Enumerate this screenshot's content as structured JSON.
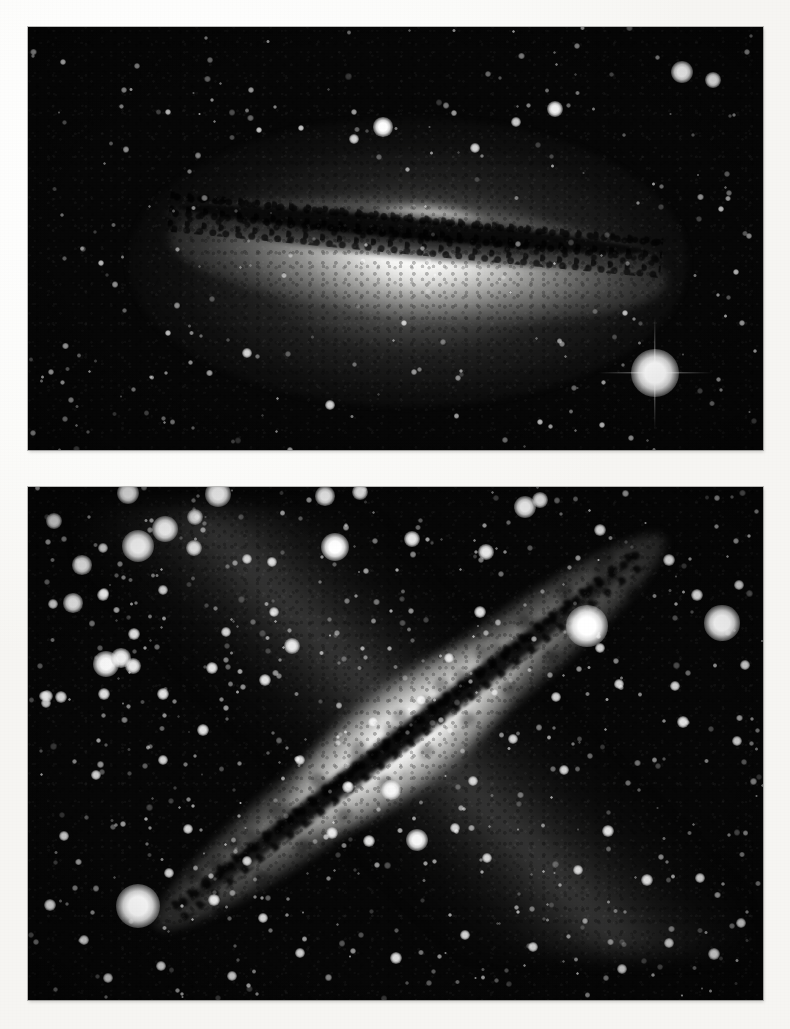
{
  "page": {
    "kind": "photographic-plate-figure",
    "background_color": "#fbfaf8",
    "width": 790,
    "height": 1029,
    "visible_text": []
  },
  "panels": [
    {
      "id": "panel-top",
      "name": "sombrero-galaxy-plate",
      "subject": "edge-on spiral galaxy with prominent equatorial dust lane and large bright bulge",
      "frame": {
        "x": 28,
        "y": 27,
        "width": 735,
        "height": 423
      },
      "image": {
        "medium": "black-and-white astronomical photograph",
        "sky_color": "#070707",
        "core_color": "#ffffff",
        "dust_lane_color": "#0a0a0a",
        "core_position": {
          "x": 390,
          "y": 243
        },
        "disk_tilt_degrees": 5.2,
        "halo_extent": {
          "width": 560,
          "height": 290
        }
      },
      "stars": [
        {
          "x": 655,
          "y": 373,
          "size": 15,
          "brightness": 1.0,
          "spikes": true
        },
        {
          "x": 682,
          "y": 72,
          "size": 7,
          "brightness": 0.9,
          "spikes": false
        },
        {
          "x": 713,
          "y": 80,
          "size": 5,
          "brightness": 0.8,
          "spikes": false
        },
        {
          "x": 555,
          "y": 109,
          "size": 5,
          "brightness": 0.8,
          "spikes": false
        },
        {
          "x": 383,
          "y": 127,
          "size": 6,
          "brightness": 0.9,
          "spikes": false
        },
        {
          "x": 354,
          "y": 139,
          "size": 3,
          "brightness": 0.6,
          "spikes": false
        },
        {
          "x": 475,
          "y": 148,
          "size": 3,
          "brightness": 0.6,
          "spikes": false
        },
        {
          "x": 516,
          "y": 122,
          "size": 3,
          "brightness": 0.55,
          "spikes": false
        },
        {
          "x": 301,
          "y": 128,
          "size": 2,
          "brightness": 0.5,
          "spikes": false
        },
        {
          "x": 259,
          "y": 130,
          "size": 2,
          "brightness": 0.5,
          "spikes": false
        },
        {
          "x": 168,
          "y": 112,
          "size": 2,
          "brightness": 0.45,
          "spikes": false
        },
        {
          "x": 63,
          "y": 62,
          "size": 2,
          "brightness": 0.45,
          "spikes": false
        },
        {
          "x": 330,
          "y": 405,
          "size": 3,
          "brightness": 0.6,
          "spikes": false
        },
        {
          "x": 247,
          "y": 353,
          "size": 3,
          "brightness": 0.6,
          "spikes": false
        },
        {
          "x": 404,
          "y": 323,
          "size": 2,
          "brightness": 0.5,
          "spikes": false
        },
        {
          "x": 540,
          "y": 422,
          "size": 2,
          "brightness": 0.5,
          "spikes": false
        },
        {
          "x": 602,
          "y": 425,
          "size": 2,
          "brightness": 0.5,
          "spikes": false
        },
        {
          "x": 168,
          "y": 333,
          "size": 2,
          "brightness": 0.45,
          "spikes": false
        },
        {
          "x": 101,
          "y": 263,
          "size": 2,
          "brightness": 0.45,
          "spikes": false
        },
        {
          "x": 721,
          "y": 209,
          "size": 2,
          "brightness": 0.45,
          "spikes": false
        },
        {
          "x": 736,
          "y": 272,
          "size": 2,
          "brightness": 0.45,
          "spikes": false
        },
        {
          "x": 625,
          "y": 313,
          "size": 2,
          "brightness": 0.45,
          "spikes": false
        }
      ]
    },
    {
      "id": "panel-bottom",
      "name": "edge-on-spiral-galaxy-plate",
      "subject": "edge-on spiral galaxy crossed by a dark dust lane, oriented diagonally, embedded in a dense star field",
      "frame": {
        "x": 28,
        "y": 487,
        "width": 735,
        "height": 513
      },
      "image": {
        "medium": "black-and-white astronomical photograph",
        "sky_color": "#080808",
        "disk_color": "#f2f2f0",
        "dust_lane_color": "#080808",
        "disk_angle_degrees": -37.5,
        "lower_left_tip": {
          "x": 70,
          "y": 960
        },
        "upper_right_tip": {
          "x": 720,
          "y": 505
        }
      },
      "stars": [
        {
          "x": 138,
          "y": 906,
          "size": 14,
          "brightness": 1.0,
          "spikes": false
        },
        {
          "x": 587,
          "y": 626,
          "size": 13,
          "brightness": 1.0,
          "spikes": false
        },
        {
          "x": 722,
          "y": 623,
          "size": 11,
          "brightness": 0.95,
          "spikes": false
        },
        {
          "x": 138,
          "y": 546,
          "size": 10,
          "brightness": 0.95,
          "spikes": false
        },
        {
          "x": 165,
          "y": 529,
          "size": 8,
          "brightness": 0.9,
          "spikes": false
        },
        {
          "x": 128,
          "y": 493,
          "size": 7,
          "brightness": 0.85,
          "spikes": false
        },
        {
          "x": 218,
          "y": 494,
          "size": 8,
          "brightness": 0.9,
          "spikes": false
        },
        {
          "x": 194,
          "y": 548,
          "size": 5,
          "brightness": 0.75,
          "spikes": false
        },
        {
          "x": 195,
          "y": 517,
          "size": 5,
          "brightness": 0.7,
          "spikes": false
        },
        {
          "x": 335,
          "y": 547,
          "size": 9,
          "brightness": 0.95,
          "spikes": false
        },
        {
          "x": 82,
          "y": 565,
          "size": 6,
          "brightness": 0.8,
          "spikes": false
        },
        {
          "x": 73,
          "y": 603,
          "size": 6,
          "brightness": 0.8,
          "spikes": false
        },
        {
          "x": 103,
          "y": 595,
          "size": 4,
          "brightness": 0.7,
          "spikes": false
        },
        {
          "x": 104,
          "y": 593,
          "size": 3,
          "brightness": 0.6,
          "spikes": false
        },
        {
          "x": 54,
          "y": 521,
          "size": 5,
          "brightness": 0.75,
          "spikes": false
        },
        {
          "x": 103,
          "y": 548,
          "size": 3,
          "brightness": 0.6,
          "spikes": false
        },
        {
          "x": 53,
          "y": 604,
          "size": 3,
          "brightness": 0.6,
          "spikes": false
        },
        {
          "x": 104,
          "y": 694,
          "size": 4,
          "brightness": 0.7,
          "spikes": false
        },
        {
          "x": 106,
          "y": 664,
          "size": 8,
          "brightness": 0.9,
          "spikes": false
        },
        {
          "x": 121,
          "y": 658,
          "size": 6,
          "brightness": 0.8,
          "spikes": false
        },
        {
          "x": 133,
          "y": 666,
          "size": 5,
          "brightness": 0.75,
          "spikes": false
        },
        {
          "x": 163,
          "y": 694,
          "size": 4,
          "brightness": 0.7,
          "spikes": false
        },
        {
          "x": 44,
          "y": 696,
          "size": 3,
          "brightness": 0.6,
          "spikes": false
        },
        {
          "x": 46,
          "y": 703,
          "size": 3,
          "brightness": 0.6,
          "spikes": false
        },
        {
          "x": 163,
          "y": 590,
          "size": 3,
          "brightness": 0.6,
          "spikes": false
        },
        {
          "x": 247,
          "y": 559,
          "size": 3,
          "brightness": 0.6,
          "spikes": false
        },
        {
          "x": 272,
          "y": 562,
          "size": 3,
          "brightness": 0.6,
          "spikes": false
        },
        {
          "x": 226,
          "y": 632,
          "size": 3,
          "brightness": 0.6,
          "spikes": false
        },
        {
          "x": 212,
          "y": 668,
          "size": 4,
          "brightness": 0.7,
          "spikes": false
        },
        {
          "x": 134,
          "y": 634,
          "size": 4,
          "brightness": 0.7,
          "spikes": false
        },
        {
          "x": 274,
          "y": 612,
          "size": 3,
          "brightness": 0.6,
          "spikes": false
        },
        {
          "x": 292,
          "y": 646,
          "size": 5,
          "brightness": 0.75,
          "spikes": false
        },
        {
          "x": 265,
          "y": 680,
          "size": 4,
          "brightness": 0.7,
          "spikes": false
        },
        {
          "x": 203,
          "y": 730,
          "size": 4,
          "brightness": 0.7,
          "spikes": false
        },
        {
          "x": 47,
          "y": 696,
          "size": 4,
          "brightness": 0.7,
          "spikes": false
        },
        {
          "x": 61,
          "y": 697,
          "size": 4,
          "brightness": 0.7,
          "spikes": false
        },
        {
          "x": 325,
          "y": 496,
          "size": 6,
          "brightness": 0.8,
          "spikes": false
        },
        {
          "x": 360,
          "y": 492,
          "size": 5,
          "brightness": 0.75,
          "spikes": false
        },
        {
          "x": 412,
          "y": 539,
          "size": 5,
          "brightness": 0.75,
          "spikes": false
        },
        {
          "x": 486,
          "y": 552,
          "size": 5,
          "brightness": 0.75,
          "spikes": false
        },
        {
          "x": 525,
          "y": 507,
          "size": 7,
          "brightness": 0.85,
          "spikes": false
        },
        {
          "x": 540,
          "y": 500,
          "size": 5,
          "brightness": 0.75,
          "spikes": false
        },
        {
          "x": 600,
          "y": 530,
          "size": 4,
          "brightness": 0.7,
          "spikes": false
        },
        {
          "x": 669,
          "y": 560,
          "size": 4,
          "brightness": 0.7,
          "spikes": false
        },
        {
          "x": 697,
          "y": 595,
          "size": 4,
          "brightness": 0.7,
          "spikes": false
        },
        {
          "x": 739,
          "y": 585,
          "size": 3,
          "brightness": 0.6,
          "spikes": false
        },
        {
          "x": 745,
          "y": 665,
          "size": 3,
          "brightness": 0.6,
          "spikes": false
        },
        {
          "x": 600,
          "y": 648,
          "size": 3,
          "brightness": 0.6,
          "spikes": false
        },
        {
          "x": 619,
          "y": 684,
          "size": 3,
          "brightness": 0.6,
          "spikes": false
        },
        {
          "x": 675,
          "y": 686,
          "size": 3,
          "brightness": 0.6,
          "spikes": false
        },
        {
          "x": 683,
          "y": 722,
          "size": 4,
          "brightness": 0.7,
          "spikes": false
        },
        {
          "x": 737,
          "y": 741,
          "size": 3,
          "brightness": 0.6,
          "spikes": false
        },
        {
          "x": 556,
          "y": 697,
          "size": 3,
          "brightness": 0.6,
          "spikes": false
        },
        {
          "x": 513,
          "y": 739,
          "size": 3,
          "brightness": 0.6,
          "spikes": false
        },
        {
          "x": 564,
          "y": 770,
          "size": 3,
          "brightness": 0.6,
          "spikes": false
        },
        {
          "x": 391,
          "y": 790,
          "size": 6,
          "brightness": 0.8,
          "spikes": false
        },
        {
          "x": 417,
          "y": 840,
          "size": 7,
          "brightness": 0.85,
          "spikes": false
        },
        {
          "x": 369,
          "y": 841,
          "size": 4,
          "brightness": 0.7,
          "spikes": false
        },
        {
          "x": 332,
          "y": 833,
          "size": 4,
          "brightness": 0.7,
          "spikes": false
        },
        {
          "x": 348,
          "y": 787,
          "size": 4,
          "brightness": 0.7,
          "spikes": false
        },
        {
          "x": 473,
          "y": 781,
          "size": 3,
          "brightness": 0.6,
          "spikes": false
        },
        {
          "x": 455,
          "y": 828,
          "size": 3,
          "brightness": 0.6,
          "spikes": false
        },
        {
          "x": 487,
          "y": 858,
          "size": 3,
          "brightness": 0.6,
          "spikes": false
        },
        {
          "x": 608,
          "y": 831,
          "size": 4,
          "brightness": 0.7,
          "spikes": false
        },
        {
          "x": 578,
          "y": 870,
          "size": 3,
          "brightness": 0.6,
          "spikes": false
        },
        {
          "x": 647,
          "y": 880,
          "size": 4,
          "brightness": 0.7,
          "spikes": false
        },
        {
          "x": 700,
          "y": 878,
          "size": 3,
          "brightness": 0.6,
          "spikes": false
        },
        {
          "x": 714,
          "y": 954,
          "size": 4,
          "brightness": 0.7,
          "spikes": false
        },
        {
          "x": 669,
          "y": 943,
          "size": 3,
          "brightness": 0.6,
          "spikes": false
        },
        {
          "x": 622,
          "y": 969,
          "size": 3,
          "brightness": 0.6,
          "spikes": false
        },
        {
          "x": 741,
          "y": 923,
          "size": 3,
          "brightness": 0.6,
          "spikes": false
        },
        {
          "x": 533,
          "y": 947,
          "size": 3,
          "brightness": 0.6,
          "spikes": false
        },
        {
          "x": 465,
          "y": 935,
          "size": 3,
          "brightness": 0.6,
          "spikes": false
        },
        {
          "x": 396,
          "y": 958,
          "size": 4,
          "brightness": 0.7,
          "spikes": false
        },
        {
          "x": 300,
          "y": 953,
          "size": 3,
          "brightness": 0.6,
          "spikes": false
        },
        {
          "x": 232,
          "y": 976,
          "size": 3,
          "brightness": 0.6,
          "spikes": false
        },
        {
          "x": 161,
          "y": 966,
          "size": 3,
          "brightness": 0.6,
          "spikes": false
        },
        {
          "x": 108,
          "y": 978,
          "size": 3,
          "brightness": 0.6,
          "spikes": false
        },
        {
          "x": 84,
          "y": 940,
          "size": 3,
          "brightness": 0.6,
          "spikes": false
        },
        {
          "x": 50,
          "y": 905,
          "size": 4,
          "brightness": 0.7,
          "spikes": false
        },
        {
          "x": 214,
          "y": 900,
          "size": 4,
          "brightness": 0.7,
          "spikes": false
        },
        {
          "x": 247,
          "y": 861,
          "size": 3,
          "brightness": 0.6,
          "spikes": false
        },
        {
          "x": 188,
          "y": 829,
          "size": 3,
          "brightness": 0.6,
          "spikes": false
        },
        {
          "x": 169,
          "y": 873,
          "size": 3,
          "brightness": 0.6,
          "spikes": false
        },
        {
          "x": 263,
          "y": 918,
          "size": 3,
          "brightness": 0.6,
          "spikes": false
        },
        {
          "x": 163,
          "y": 760,
          "size": 3,
          "brightness": 0.6,
          "spikes": false
        },
        {
          "x": 96,
          "y": 775,
          "size": 3,
          "brightness": 0.6,
          "spikes": false
        },
        {
          "x": 64,
          "y": 836,
          "size": 3,
          "brightness": 0.6,
          "spikes": false
        },
        {
          "x": 480,
          "y": 612,
          "size": 4,
          "brightness": 0.7,
          "spikes": false
        },
        {
          "x": 449,
          "y": 658,
          "size": 3,
          "brightness": 0.6,
          "spikes": false
        },
        {
          "x": 421,
          "y": 700,
          "size": 3,
          "brightness": 0.6,
          "spikes": false
        },
        {
          "x": 373,
          "y": 722,
          "size": 3,
          "brightness": 0.6,
          "spikes": false
        },
        {
          "x": 300,
          "y": 760,
          "size": 3,
          "brightness": 0.6,
          "spikes": false
        }
      ]
    }
  ]
}
